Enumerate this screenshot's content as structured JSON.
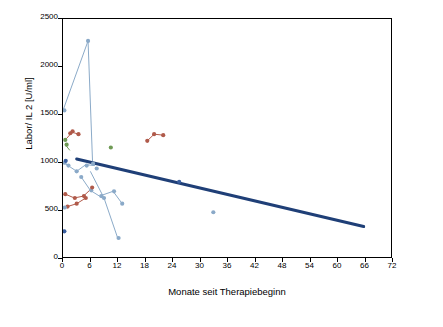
{
  "chart_data": {
    "type": "scatter",
    "title": "",
    "xlabel": "Monate seit Therapiebeginn",
    "ylabel": "Labor/ IL 2  [U/ml]",
    "xlim": [
      0,
      72
    ],
    "ylim": [
      0,
      2500
    ],
    "xticks": [
      0,
      6,
      12,
      18,
      24,
      30,
      36,
      42,
      48,
      54,
      60,
      66,
      72
    ],
    "yticks": [
      0,
      500,
      1000,
      1500,
      2000,
      2500
    ],
    "grid": false,
    "legend": "none",
    "trendline": {
      "name": "Trend",
      "color": "#1f3f77",
      "width": 3,
      "x": [
        3,
        66
      ],
      "y": [
        1030,
        320
      ]
    },
    "series": [
      {
        "name": "Patient 1",
        "color": "#8aa9c8",
        "x": [
          0,
          5.5
        ],
        "y": [
          1540,
          2270
        ]
      },
      {
        "name": "Patient 2",
        "color": "#8aa9c8",
        "x": [
          5.5,
          6.5
        ],
        "y": [
          2270,
          980
        ]
      },
      {
        "name": "Patient 3",
        "color": "#b05a4a",
        "x": [
          0.5,
          2.0,
          3.5
        ],
        "y": [
          1230,
          1310,
          1290
        ]
      },
      {
        "name": "Patient 4",
        "color": "#b05a4a",
        "x": [
          18.5,
          20.0,
          22.0
        ],
        "y": [
          1220,
          1290,
          1280
        ]
      },
      {
        "name": "Patient 5",
        "color": "#8aa9c8",
        "x": [
          0.5,
          3.0,
          5.0,
          7.0
        ],
        "y": [
          980,
          900,
          970,
          960
        ]
      },
      {
        "name": "Patient 6",
        "color": "#8aa9c8",
        "x": [
          4.0,
          6.0,
          8.0,
          11.0,
          13.0
        ],
        "y": [
          840,
          700,
          640,
          690,
          560
        ]
      },
      {
        "name": "Patient 7",
        "color": "#b05a4a",
        "x": [
          0.5,
          2.5,
          4.5,
          6.5
        ],
        "y": [
          660,
          620,
          640,
          730
        ]
      },
      {
        "name": "Patient 8",
        "color": "#b05a4a",
        "x": [
          1.0,
          3.0,
          5.0
        ],
        "y": [
          530,
          560,
          620
        ]
      },
      {
        "name": "Patient 9",
        "color": "#8aa9c8",
        "x": [
          6.0,
          9.0,
          12.0
        ],
        "y": [
          900,
          620,
          200
        ]
      },
      {
        "name": "Patient 10",
        "color": "#6f9a55",
        "x": [
          0.5,
          1.5
        ],
        "y": [
          1180,
          1120
        ]
      }
    ],
    "points": [
      {
        "x": 0.3,
        "y": 1540,
        "color": "#8aa9c8"
      },
      {
        "x": 5.5,
        "y": 2270,
        "color": "#8aa9c8"
      },
      {
        "x": 0.5,
        "y": 1230,
        "color": "#6f9a55"
      },
      {
        "x": 0.8,
        "y": 1180,
        "color": "#6f9a55"
      },
      {
        "x": 1.6,
        "y": 1300,
        "color": "#b05a4a"
      },
      {
        "x": 2.1,
        "y": 1320,
        "color": "#b05a4a"
      },
      {
        "x": 3.4,
        "y": 1290,
        "color": "#b05a4a"
      },
      {
        "x": 10.5,
        "y": 1150,
        "color": "#6f9a55"
      },
      {
        "x": 18.5,
        "y": 1220,
        "color": "#b05a4a"
      },
      {
        "x": 20.0,
        "y": 1290,
        "color": "#b05a4a"
      },
      {
        "x": 22.0,
        "y": 1280,
        "color": "#b05a4a"
      },
      {
        "x": 0.4,
        "y": 990,
        "color": "#8aa9c8"
      },
      {
        "x": 1.2,
        "y": 960,
        "color": "#8aa9c8"
      },
      {
        "x": 3.0,
        "y": 900,
        "color": "#8aa9c8"
      },
      {
        "x": 5.2,
        "y": 960,
        "color": "#8aa9c8"
      },
      {
        "x": 6.6,
        "y": 980,
        "color": "#8aa9c8"
      },
      {
        "x": 7.4,
        "y": 930,
        "color": "#8aa9c8"
      },
      {
        "x": 4.0,
        "y": 840,
        "color": "#8aa9c8"
      },
      {
        "x": 6.2,
        "y": 700,
        "color": "#8aa9c8"
      },
      {
        "x": 8.4,
        "y": 640,
        "color": "#8aa9c8"
      },
      {
        "x": 11.2,
        "y": 690,
        "color": "#8aa9c8"
      },
      {
        "x": 13.0,
        "y": 560,
        "color": "#8aa9c8"
      },
      {
        "x": 0.5,
        "y": 660,
        "color": "#b05a4a"
      },
      {
        "x": 2.6,
        "y": 620,
        "color": "#b05a4a"
      },
      {
        "x": 4.6,
        "y": 640,
        "color": "#b05a4a"
      },
      {
        "x": 6.4,
        "y": 730,
        "color": "#b05a4a"
      },
      {
        "x": 1.0,
        "y": 530,
        "color": "#b05a4a"
      },
      {
        "x": 3.0,
        "y": 560,
        "color": "#b05a4a"
      },
      {
        "x": 5.0,
        "y": 620,
        "color": "#b05a4a"
      },
      {
        "x": 0.4,
        "y": 520,
        "color": "#8aa9c8"
      },
      {
        "x": 0.3,
        "y": 270,
        "color": "#3a5fa0"
      },
      {
        "x": 9.0,
        "y": 620,
        "color": "#8aa9c8"
      },
      {
        "x": 12.2,
        "y": 200,
        "color": "#8aa9c8"
      },
      {
        "x": 25.5,
        "y": 790,
        "color": "#3a5fa0"
      },
      {
        "x": 33.0,
        "y": 470,
        "color": "#8aa9c8"
      },
      {
        "x": 0.6,
        "y": 1010,
        "color": "#3a5fa0"
      }
    ]
  },
  "axis": {
    "y_title": "Labor/ IL 2  [U/ml]",
    "x_title": "Monate seit Therapiebeginn",
    "y_labels": [
      "0",
      "500",
      "1000",
      "1500",
      "2000",
      "2500"
    ],
    "x_labels": [
      "0",
      "6",
      "12",
      "18",
      "24",
      "30",
      "36",
      "42",
      "48",
      "54",
      "60",
      "66",
      "72"
    ]
  }
}
